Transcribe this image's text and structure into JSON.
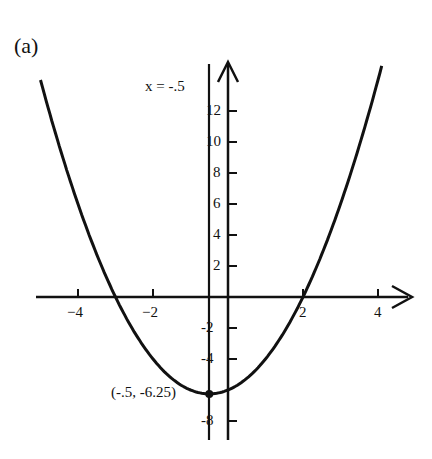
{
  "panel_label": "(a)",
  "chart_data": {
    "type": "line",
    "title": "",
    "function": "y = x^2 + x - 6",
    "xlabel": "",
    "ylabel": "",
    "xlim": [
      -5.0,
      4.9
    ],
    "ylim": [
      -9.5,
      15
    ],
    "grid": false,
    "x_ticks": [
      -4,
      -2,
      2,
      4
    ],
    "x_tick_labels": [
      "−4",
      "−2",
      "2",
      "4"
    ],
    "y_ticks": [
      -8,
      -4,
      -2,
      2,
      4,
      6,
      8,
      10,
      12
    ],
    "y_tick_labels": [
      "-8",
      "-4",
      "-2",
      "2",
      "4",
      "6",
      "8",
      "10",
      "12"
    ],
    "axis_of_symmetry": {
      "x": -0.5,
      "label": "x = -.5"
    },
    "vertex": {
      "x": -0.5,
      "y": -6.25,
      "label": "(-.5,  -6.25)"
    },
    "series": [
      {
        "name": "parabola",
        "x": [
          -5.0,
          -4.5,
          -4.0,
          -3.5,
          -3.0,
          -2.5,
          -2.0,
          -1.5,
          -1.0,
          -0.5,
          0.0,
          0.5,
          1.0,
          1.5,
          2.0,
          2.5,
          3.0,
          3.5,
          4.0,
          4.5,
          4.9
        ],
        "values": [
          14.0,
          9.75,
          6.0,
          2.75,
          0.0,
          -2.25,
          -4.0,
          -5.25,
          -6.0,
          -6.25,
          -6.0,
          -5.25,
          -4.0,
          -2.25,
          0.0,
          2.75,
          6.0,
          9.75,
          14.0,
          18.75,
          23.91
        ]
      }
    ]
  },
  "colors": {
    "ink": "#111111",
    "background": "#ffffff"
  }
}
